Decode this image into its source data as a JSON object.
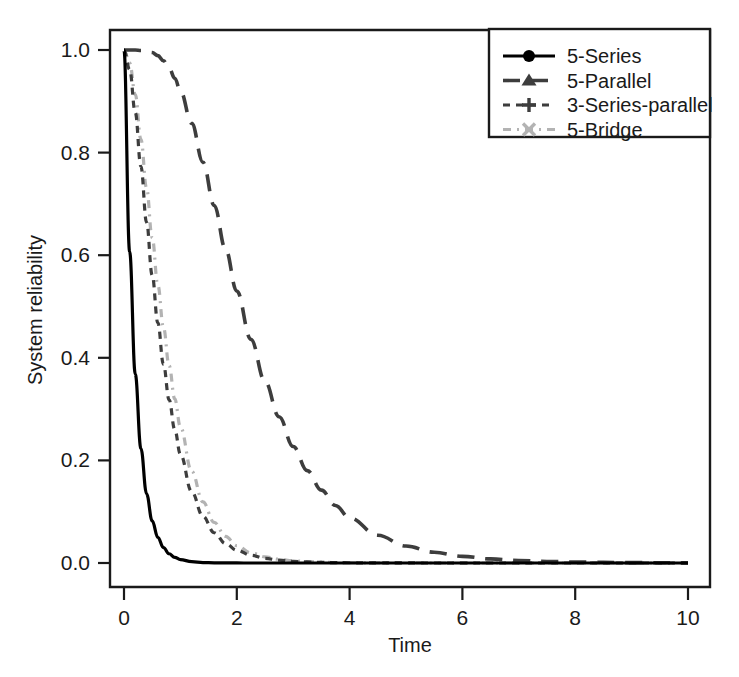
{
  "chart_data": {
    "type": "line",
    "title": "",
    "subtitle": "",
    "xlabel": "Time",
    "ylabel": "System reliability",
    "xlim": [
      0,
      10
    ],
    "ylim": [
      0,
      1.0
    ],
    "xticks": [
      0,
      2,
      4,
      6,
      8,
      10
    ],
    "yticks": [
      0.0,
      0.2,
      0.4,
      0.6,
      0.8,
      1.0
    ],
    "xtick_labels": [
      "0",
      "2",
      "4",
      "6",
      "8",
      "10"
    ],
    "ytick_labels": [
      "0.0",
      "0.2",
      "0.4",
      "0.6",
      "0.8",
      "1.0"
    ],
    "grid": false,
    "legend_position": "top-right",
    "x": [
      0,
      0.1,
      0.2,
      0.3,
      0.4,
      0.5,
      0.6,
      0.7,
      0.8,
      0.9,
      1.0,
      1.2,
      1.4,
      1.6,
      1.8,
      2.0,
      2.25,
      2.5,
      2.75,
      3.0,
      3.25,
      3.5,
      3.75,
      4.0,
      4.5,
      5.0,
      5.5,
      6.0,
      6.5,
      7.0,
      7.5,
      8.0,
      9.0,
      10.0
    ],
    "series": [
      {
        "name": "5-Series",
        "color": "#000000",
        "linestyle": "solid",
        "marker": "filled-circle",
        "values": [
          1.0,
          0.607,
          0.368,
          0.223,
          0.135,
          0.082,
          0.05,
          0.03,
          0.018,
          0.011,
          0.0067,
          0.0025,
          0.0009,
          0.0003,
          0.0001,
          5e-05,
          2e-05,
          1e-05,
          0.0,
          0.0,
          0.0,
          0.0,
          0.0,
          0.0,
          0.0,
          0.0,
          0.0,
          0.0,
          0.0,
          0.0,
          0.0,
          0.0,
          0.0,
          0.0
        ]
      },
      {
        "name": "5-Parallel",
        "color": "#3d3d3d",
        "linestyle": "long-dash",
        "marker": "filled-triangle",
        "values": [
          1.0,
          1.0,
          1.0,
          0.999,
          0.998,
          0.995,
          0.989,
          0.979,
          0.965,
          0.945,
          0.92,
          0.857,
          0.781,
          0.697,
          0.612,
          0.53,
          0.436,
          0.354,
          0.285,
          0.227,
          0.18,
          0.142,
          0.112,
          0.088,
          0.054,
          0.033,
          0.021,
          0.013,
          0.008,
          0.0049,
          0.003,
          0.0018,
          0.00068,
          0.00025
        ]
      },
      {
        "name": "3-Series-parallel",
        "color": "#3d3d3d",
        "linestyle": "dash-dot-short",
        "marker": "plus",
        "values": [
          1.0,
          0.962,
          0.878,
          0.773,
          0.664,
          0.561,
          0.468,
          0.387,
          0.318,
          0.26,
          0.212,
          0.139,
          0.091,
          0.059,
          0.038,
          0.025,
          0.015,
          0.009,
          0.0055,
          0.0033,
          0.002,
          0.0012,
          0.0007,
          0.00045,
          0.00017,
          6e-05,
          2e-05,
          1e-05,
          0.0,
          0.0,
          0.0,
          0.0,
          0.0,
          0.0
        ]
      },
      {
        "name": "5-Bridge",
        "color": "#b3b3b3",
        "linestyle": "dash-dot-light",
        "marker": "cross-x",
        "values": [
          1.0,
          0.975,
          0.913,
          0.826,
          0.731,
          0.634,
          0.542,
          0.459,
          0.385,
          0.32,
          0.265,
          0.179,
          0.119,
          0.079,
          0.052,
          0.034,
          0.02,
          0.012,
          0.0073,
          0.0044,
          0.0026,
          0.0016,
          0.0009,
          0.00056,
          0.0002,
          7e-05,
          3e-05,
          1e-05,
          0.0,
          0.0,
          0.0,
          0.0,
          0.0,
          0.0
        ]
      }
    ]
  },
  "legend": {
    "entries": [
      {
        "label": "5-Series",
        "color": "#000000",
        "marker": "filled-circle",
        "linestyle": "solid"
      },
      {
        "label": "5-Parallel",
        "color": "#3d3d3d",
        "marker": "filled-triangle",
        "linestyle": "long-dash"
      },
      {
        "label": "3-Series-parallel",
        "color": "#3d3d3d",
        "marker": "plus",
        "linestyle": "dash-dot-short"
      },
      {
        "label": "5-Bridge",
        "color": "#b3b3b3",
        "marker": "cross-x",
        "linestyle": "dash-dot-light"
      }
    ]
  },
  "colors": {
    "background": "#ffffff",
    "axis": "#1a1a1a",
    "series_black": "#000000",
    "series_dark_gray": "#3d3d3d",
    "series_light_gray": "#b3b3b3"
  }
}
